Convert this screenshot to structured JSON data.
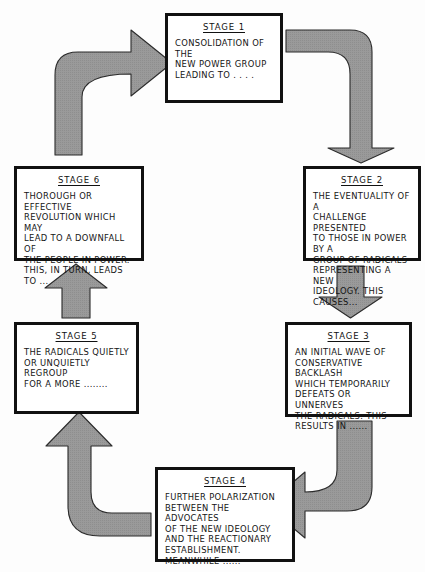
{
  "diagram": {
    "colors": {
      "arrow_fill": "#9a9a9a",
      "arrow_stroke": "#2b2b2b",
      "box_border": "#111111",
      "background": "#fdfdfd",
      "text": "#141414"
    },
    "stages": [
      {
        "id": "stage-1",
        "title": "STAGE 1",
        "body": "CONSOLIDATION OF THE\nNEW POWER GROUP\nLEADING TO . . . ."
      },
      {
        "id": "stage-2",
        "title": "STAGE 2",
        "body": "THE EVENTUALITY OF A\nCHALLENGE PRESENTED\nTO THOSE IN POWER BY A\nGROUP OF RADICALS\nREPRESENTING A NEW\nIDEOLOGY. THIS CAUSES..."
      },
      {
        "id": "stage-3",
        "title": "STAGE 3",
        "body": "AN INITIAL WAVE OF\nCONSERVATIVE BACKLASH\nWHICH TEMPORARILY\nDEFEATS OR UNNERVES\nTHE RADICALS. THIS\nRESULTS IN ......"
      },
      {
        "id": "stage-4",
        "title": "STAGE 4",
        "body": "FURTHER POLARIZATION\nBETWEEN THE ADVOCATES\nOF THE NEW IDEOLOGY\nAND THE REACTIONARY\nESTABLISHMENT.\nMEANWHILE ......"
      },
      {
        "id": "stage-5",
        "title": "STAGE 5",
        "body": "THE RADICALS QUIETLY\nOR UNQUIETLY REGROUP\nFOR A MORE ........"
      },
      {
        "id": "stage-6",
        "title": "STAGE 6",
        "body": "THOROUGH OR EFFECTIVE\nREVOLUTION WHICH MAY\nLEAD TO A DOWNFALL OF\nTHE PEOPLE IN POWER.\nTHIS, IN TURN, LEADS TO ..."
      }
    ],
    "arrows": [
      {
        "id": "arrow-6-to-1",
        "from": "stage-6",
        "to": "stage-1",
        "shape": "elbow-up-right"
      },
      {
        "id": "arrow-1-to-2",
        "from": "stage-1",
        "to": "stage-2",
        "shape": "elbow-right-down"
      },
      {
        "id": "arrow-2-to-3",
        "from": "stage-2",
        "to": "stage-3",
        "shape": "straight-down"
      },
      {
        "id": "arrow-3-to-4",
        "from": "stage-3",
        "to": "stage-4",
        "shape": "elbow-down-left"
      },
      {
        "id": "arrow-4-to-5",
        "from": "stage-4",
        "to": "stage-5",
        "shape": "elbow-left-up"
      },
      {
        "id": "arrow-5-to-6",
        "from": "stage-5",
        "to": "stage-6",
        "shape": "straight-up"
      }
    ]
  }
}
